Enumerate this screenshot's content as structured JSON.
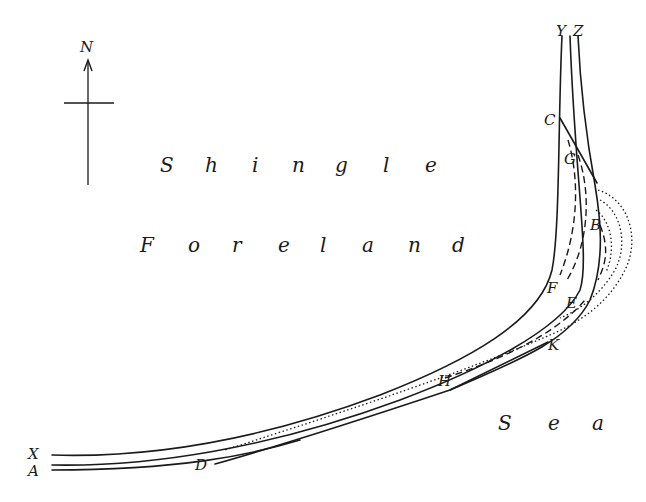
{
  "compass": {
    "label": "N"
  },
  "regions": {
    "land_line1": [
      "S",
      "h",
      "i",
      "n",
      "g",
      "l",
      "e"
    ],
    "land_line2": [
      "F",
      "o",
      "r",
      "e",
      "l",
      "a",
      "n",
      "d"
    ],
    "sea": [
      "S",
      "e",
      "a"
    ]
  },
  "points": {
    "X": "X",
    "A": "A",
    "Y": "Y",
    "Z": "Z",
    "C": "C",
    "G": "G",
    "B": "B",
    "F": "F",
    "E": "E",
    "K": "K",
    "H": "H",
    "D": "D"
  },
  "colors": {
    "ink": "#1a1a1a",
    "paper": "#ffffff"
  }
}
